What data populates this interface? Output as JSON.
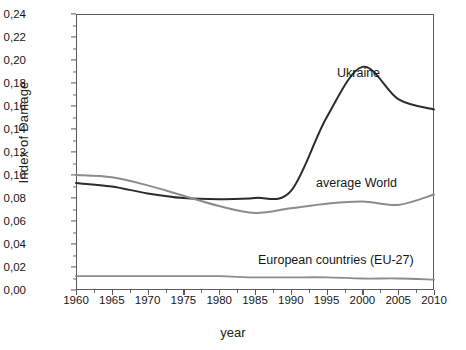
{
  "chart_data": {
    "type": "line",
    "title": "",
    "xlabel": "year",
    "ylabel": "Index of Damage",
    "xlim": [
      1960,
      2010
    ],
    "ylim": [
      0.0,
      0.24
    ],
    "grid": false,
    "legend_position": "inline-annotations",
    "decimal_separator": ",",
    "x_tick_labels": [
      "1960",
      "1965",
      "1970",
      "1975",
      "1980",
      "1985",
      "1990",
      "1995",
      "2000",
      "2005",
      "2010"
    ],
    "x_ticks": [
      1960,
      1965,
      1970,
      1975,
      1980,
      1985,
      1990,
      1995,
      2000,
      2005,
      2010
    ],
    "y_tick_labels": [
      "0,00",
      "0,02",
      "0,04",
      "0,06",
      "0,08",
      "0,10",
      "0,12",
      "0,14",
      "0,16",
      "0,18",
      "0,20",
      "0,22",
      "0,24"
    ],
    "y_ticks": [
      0.0,
      0.02,
      0.04,
      0.06,
      0.08,
      0.1,
      0.12,
      0.14,
      0.16,
      0.18,
      0.2,
      0.22,
      0.24
    ],
    "x": [
      1960,
      1965,
      1970,
      1975,
      1980,
      1985,
      1990,
      1995,
      2000,
      2005,
      2010
    ],
    "series": [
      {
        "name": "Ukraine",
        "color": "#2b2b2b",
        "width": 2.0,
        "label_text": "Ukraine",
        "values": [
          0.093,
          0.09,
          0.084,
          0.08,
          0.079,
          0.08,
          0.086,
          0.15,
          0.194,
          0.166,
          0.157
        ]
      },
      {
        "name": "average World",
        "color": "#8c8c8c",
        "width": 2.0,
        "label_text": "average World",
        "values": [
          0.1,
          0.098,
          0.091,
          0.082,
          0.073,
          0.067,
          0.071,
          0.075,
          0.077,
          0.074,
          0.083
        ]
      },
      {
        "name": "European countries (EU-27)",
        "color": "#8c8c8c",
        "width": 1.8,
        "label_text": "European countries (EU-27)",
        "values": [
          0.012,
          0.012,
          0.012,
          0.012,
          0.012,
          0.011,
          0.011,
          0.011,
          0.01,
          0.01,
          0.009
        ]
      }
    ]
  }
}
